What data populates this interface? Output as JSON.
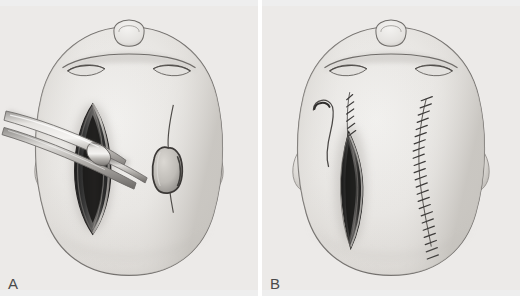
{
  "figure": {
    "view": "vertex (top-down) view of head",
    "background_color": "#ffffff",
    "panel_background_color": "#eeeeee",
    "ink_color": "#555555",
    "skin_base_color": "#e9e7e4",
    "skin_shadow_color": "#c9c6c2",
    "wound_dark_color": "#2b2b2b",
    "instrument_color": "#bdbdbd",
    "suture_color": "#4a4a4a"
  },
  "panels": [
    {
      "id": "panel-a",
      "label": "A",
      "caption_text": "A",
      "elements": [
        {
          "name": "head-outline",
          "description": "Oval vertex view of head with nose and closed eyes at top, ears at sides"
        },
        {
          "name": "nose",
          "description": "Small rounded nose bridge at top center"
        },
        {
          "name": "eyebrow-left",
          "description": "Closed left eye / brow arc"
        },
        {
          "name": "eyebrow-right",
          "description": "Closed right eye / brow arc"
        },
        {
          "name": "ear-left",
          "description": "Left ear seen from above"
        },
        {
          "name": "ear-right",
          "description": "Right ear seen from above"
        },
        {
          "name": "primary-incision-open",
          "description": "Large vertical lenticular scalp incision held open, dark interior"
        },
        {
          "name": "surgical-instrument",
          "description": "Long tunneling forceps / passer inserted into the open incision from the left"
        },
        {
          "name": "secondary-incision-open",
          "description": "Smaller oval opening with thin curved linear incision extending above and below"
        }
      ]
    },
    {
      "id": "panel-b",
      "label": "B",
      "caption_text": "B",
      "elements": [
        {
          "name": "head-outline",
          "description": "Oval vertex view of head with nose and closed eyes at top, ears at sides"
        },
        {
          "name": "nose",
          "description": "Small rounded nose bridge at top center"
        },
        {
          "name": "eyebrow-left",
          "description": "Closed left eye / brow arc"
        },
        {
          "name": "eyebrow-right",
          "description": "Closed right eye / brow arc"
        },
        {
          "name": "ear-left",
          "description": "Left ear seen from above"
        },
        {
          "name": "ear-right",
          "description": "Right ear seen from above"
        },
        {
          "name": "suture-needle-thread",
          "description": "Curved suture needle with trailing thread at upper left of the wound"
        },
        {
          "name": "primary-incision-partially-closed",
          "description": "Tapered wound partly closed with interrupted sutures at its superior end"
        },
        {
          "name": "suture-line-closed",
          "description": "Long curved line of interrupted sutures closing the second incision"
        }
      ],
      "suture_counts": {
        "primary_wound_stitches": 6,
        "closed_incision_stitches": 23
      }
    }
  ]
}
